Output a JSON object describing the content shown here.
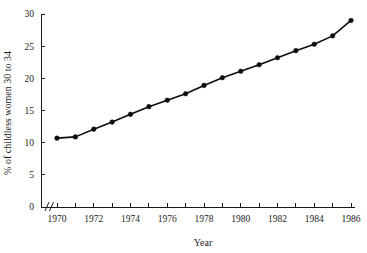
{
  "chart_data": {
    "type": "line",
    "title": "",
    "xlabel": "Year",
    "ylabel": "% of childless women 30 to 34",
    "x": [
      1970,
      1971,
      1972,
      1973,
      1974,
      1975,
      1976,
      1977,
      1978,
      1979,
      1980,
      1981,
      1982,
      1983,
      1984,
      1985,
      1986
    ],
    "values": [
      10.7,
      10.9,
      12.1,
      13.2,
      14.4,
      15.6,
      16.6,
      17.6,
      18.9,
      20.1,
      21.1,
      22.1,
      23.2,
      24.3,
      25.3,
      26.6,
      29.0
    ],
    "series": [
      {
        "name": "% of childless women 30 to 34",
        "values": [
          10.7,
          10.9,
          12.1,
          13.2,
          14.4,
          15.6,
          16.6,
          17.6,
          18.9,
          20.1,
          21.1,
          22.1,
          23.2,
          24.3,
          25.3,
          26.6,
          29.0
        ]
      }
    ],
    "xlim": [
      1969.5,
      1986.5
    ],
    "ylim": [
      0,
      30
    ],
    "y_ticks": [
      0,
      5,
      10,
      15,
      20,
      25,
      30
    ],
    "y_tick_labels": [
      "0",
      "5",
      "10",
      "15",
      "20",
      "25",
      "30"
    ],
    "x_ticks": [
      1970,
      1971,
      1972,
      1973,
      1974,
      1975,
      1976,
      1977,
      1978,
      1979,
      1980,
      1981,
      1982,
      1983,
      1984,
      1985,
      1986
    ],
    "x_tick_labels_shown": [
      "1970",
      "1972",
      "1974",
      "1976",
      "1978",
      "1980",
      "1982",
      "1984",
      "1986"
    ],
    "x_labeled_ticks": [
      1970,
      1972,
      1974,
      1976,
      1978,
      1980,
      1982,
      1984,
      1986
    ],
    "grid": false,
    "legend": false,
    "legend_position": "none",
    "axis_break_x": true,
    "marker": "filled-circle",
    "line_color": "#0d0d0d",
    "marker_color": "#0d0d0d",
    "axis_color": "#1c1c1c",
    "background": "#ffffff"
  }
}
